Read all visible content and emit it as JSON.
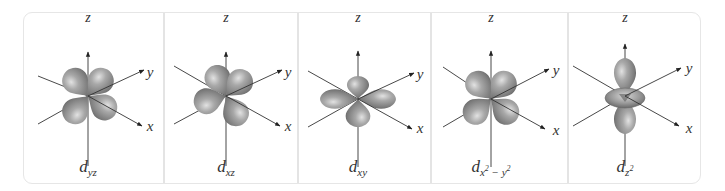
{
  "figure": {
    "axis_labels": {
      "z": "z",
      "y": "y",
      "x": "x"
    },
    "colors": {
      "lobe_dark": "#6f6f6f",
      "lobe_mid": "#9a9a9a",
      "lobe_light": "#dcdcdc",
      "axis": "#333333",
      "frame": "#e6e6e6"
    },
    "panels": [
      {
        "id": "dyz",
        "symbol": "d",
        "subscript": "yz",
        "orientation": "yz-plane lobes between axes"
      },
      {
        "id": "dxz",
        "symbol": "d",
        "subscript": "xz",
        "orientation": "xz-plane lobes between axes"
      },
      {
        "id": "dxy",
        "symbol": "d",
        "subscript": "xy",
        "orientation": "xy-plane lobes between axes"
      },
      {
        "id": "dx2-y2",
        "symbol": "d",
        "subscript_pre": "x",
        "sup1": "2",
        "subscript_mid": " − y",
        "sup2": "2",
        "orientation": "lobes along x and y axes"
      },
      {
        "id": "dz2",
        "symbol": "d",
        "subscript": "z",
        "sup": "2",
        "orientation": "lobes along z axis with torus in xy-plane"
      }
    ]
  }
}
